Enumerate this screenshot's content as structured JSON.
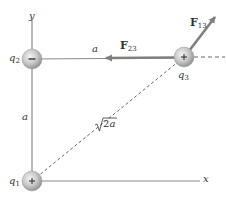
{
  "figure": {
    "type": "electrostatics-three-charges",
    "colors": {
      "axis": "#8a8a8a",
      "force_arrow": "#7f7f7f",
      "dashed": "#666666",
      "sphere_light": "#f2f2f2",
      "sphere_dark": "#9a9a9a",
      "text": "#333333"
    },
    "axes": {
      "x_label": "x",
      "y_label": "y"
    },
    "charges": [
      {
        "id": "q1",
        "label_base": "q",
        "label_sub": "1",
        "sign": "+",
        "position": "origin"
      },
      {
        "id": "q2",
        "label_base": "q",
        "label_sub": "2",
        "sign": "−",
        "position": "on y-axis at distance a"
      },
      {
        "id": "q3",
        "label_base": "q",
        "label_sub": "3",
        "sign": "+",
        "position": "corner (a, a)"
      }
    ],
    "distances": {
      "q1_q2": "a",
      "q2_q3": "a",
      "q1_q3_root": "2",
      "q1_q3_var": "a"
    },
    "forces": [
      {
        "id": "F23",
        "label_base": "F",
        "label_sub": "23",
        "direction": "left, toward q2"
      },
      {
        "id": "F13",
        "label_base": "F",
        "label_sub": "13",
        "direction": "up-right, away from q1"
      }
    ]
  }
}
